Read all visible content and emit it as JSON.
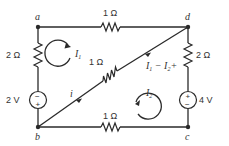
{
  "diagram": {
    "type": "circuit",
    "nodes": [
      {
        "id": "a",
        "label": "a"
      },
      {
        "id": "b",
        "label": "b"
      },
      {
        "id": "c",
        "label": "c"
      },
      {
        "id": "d",
        "label": "d"
      }
    ],
    "components": {
      "r_top": {
        "between": "a-d",
        "label": "1 Ω"
      },
      "r_left": {
        "between": "a-b",
        "label": "2 Ω"
      },
      "r_diag": {
        "between": "b-d",
        "label": "1 Ω"
      },
      "r_right": {
        "between": "d-c",
        "label": "2 Ω"
      },
      "r_bottom": {
        "between": "b-c",
        "label": "1 Ω"
      },
      "v_left": {
        "between": "a-b",
        "label": "2 V",
        "top_sign": "−",
        "bottom_sign": "+"
      },
      "v_right": {
        "between": "d-c",
        "label": "4 V",
        "top_sign": "+",
        "bottom_sign": "−"
      }
    },
    "loops": {
      "loop1": {
        "label": "I",
        "sub": "1",
        "direction": "clockwise"
      },
      "loop2": {
        "label": "I",
        "sub": "2",
        "direction": "counterclockwise"
      }
    },
    "currents": {
      "i_label": "i",
      "diag_label_a": "I",
      "diag_sub_a": "1",
      "diag_mid": " − ",
      "diag_label_b": "I",
      "diag_sub_b": "2",
      "diag_plus": "+"
    }
  }
}
